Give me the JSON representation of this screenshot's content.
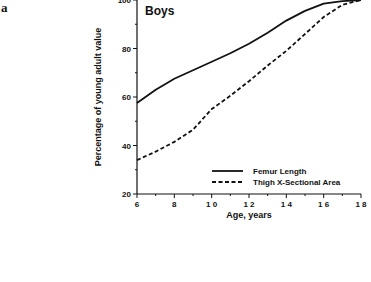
{
  "panel_label": "a",
  "chart_data": {
    "type": "line",
    "title": "Boys",
    "xlabel": "Age,  years",
    "ylabel": "Percentage of young adult value",
    "xlim": [
      6,
      18
    ],
    "ylim": [
      20,
      100
    ],
    "x_ticks": [
      "6",
      "8",
      "1 0",
      "1 2",
      "1 4",
      "1 6",
      "1 8"
    ],
    "x_tick_values": [
      6,
      8,
      10,
      12,
      14,
      16,
      18
    ],
    "y_ticks": [
      "20",
      "40",
      "60",
      "80",
      "100"
    ],
    "y_tick_values": [
      20,
      40,
      60,
      80,
      100
    ],
    "grid": false,
    "legend_position": "lower right",
    "x": [
      6,
      7,
      8,
      9,
      10,
      11,
      12,
      13,
      14,
      15,
      16,
      17,
      18
    ],
    "series": [
      {
        "name": "Femur Length",
        "style": "solid",
        "values": [
          57.5,
          63,
          67.5,
          71,
          74.5,
          78,
          82,
          86.5,
          91.5,
          95.5,
          98.5,
          99.5,
          100
        ]
      },
      {
        "name": "Thigh X-Sectional Area",
        "style": "dashed",
        "values": [
          34,
          37.5,
          41.5,
          46.5,
          55,
          60.5,
          66.5,
          73,
          79,
          86,
          93,
          98,
          100
        ]
      }
    ]
  },
  "colors": {
    "line": "#111111",
    "background": "#ffffff"
  }
}
